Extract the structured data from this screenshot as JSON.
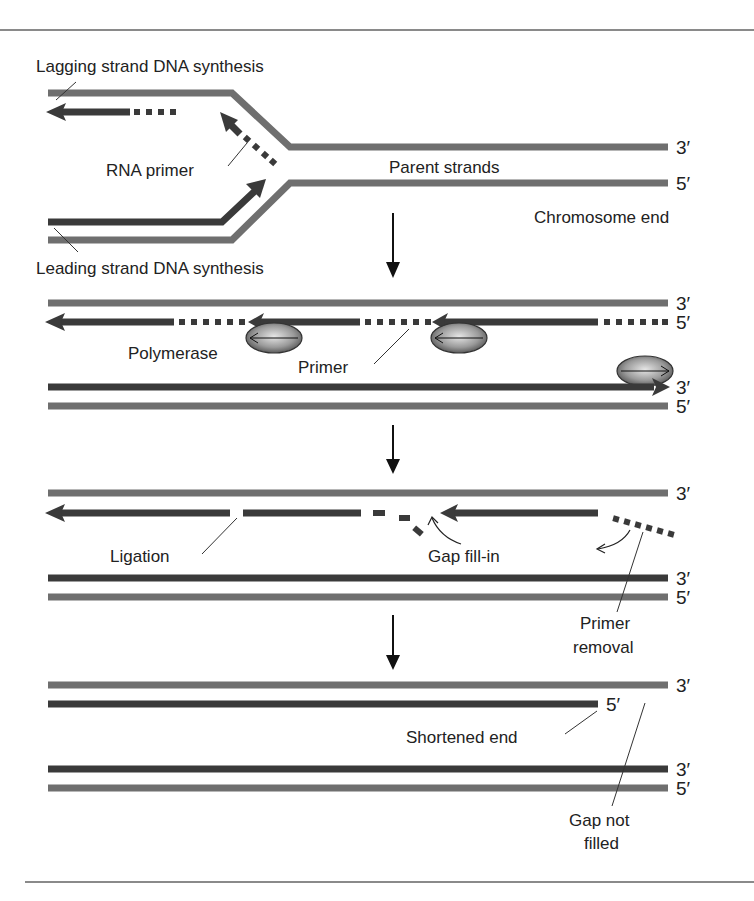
{
  "figure": {
    "colors": {
      "parent_strand": "#6f6f6f",
      "new_strand": "#3a3a3a",
      "primer": "#3a3a3a",
      "text": "#222222",
      "rule": "#8a8a8a",
      "polymerase_light": "#d9d9d9",
      "polymerase_dark": "#555555"
    },
    "panel1": {
      "lagging_label": "Lagging strand DNA synthesis",
      "rna_primer_label": "RNA primer",
      "parent_label": "Parent strands",
      "leading_label": "Leading strand DNA synthesis",
      "chromosome_end_label": "Chromosome end",
      "end_top": "3′",
      "end_bottom": "5′"
    },
    "panel2": {
      "polymerase_label": "Polymerase",
      "primer_label": "Primer",
      "end_1": "3′",
      "end_2": "5′",
      "end_3": "3′",
      "end_4": "5′"
    },
    "panel3": {
      "ligation_label": "Ligation",
      "gap_fill_label": "Gap fill-in",
      "primer_removal_label_1": "Primer",
      "primer_removal_label_2": "removal",
      "end_1": "3′",
      "end_3": "3′",
      "end_4": "5′"
    },
    "panel4": {
      "shortened_label": "Shortened end",
      "gap_label_1": "Gap not",
      "gap_label_2": "filled",
      "end_1": "3′",
      "end_2": "5′",
      "end_3": "3′",
      "end_4": "5′"
    }
  }
}
